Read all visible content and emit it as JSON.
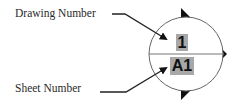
{
  "labels": {
    "drawing_number": "Drawing Number",
    "sheet_number": "Sheet Number"
  },
  "symbol": {
    "type": "section-marker-callout",
    "drawing_number": "1",
    "sheet_number": "A1",
    "highlight_color": "#a8a8a8",
    "line_color": "#555555",
    "arrow_color": "#111111"
  }
}
